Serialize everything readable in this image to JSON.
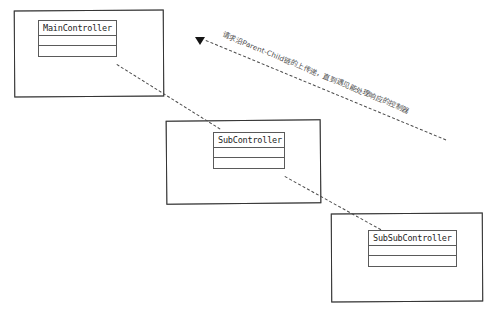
{
  "diagram": {
    "background_color": "#ffffff",
    "line_color": "#4a4a4a",
    "text_color": "#1d1d1d"
  },
  "frames": [
    {
      "id": "main",
      "label": "main-controller-frame"
    },
    {
      "id": "sub",
      "label": "sub-controller-frame"
    },
    {
      "id": "subsub",
      "label": "sub-sub-controller-frame"
    }
  ],
  "classes": [
    {
      "name": "MainController",
      "compartments": [
        "",
        ""
      ]
    },
    {
      "name": "SubController",
      "compartments": [
        "",
        ""
      ]
    },
    {
      "name": "SubSubController",
      "compartments": [
        "",
        ""
      ]
    }
  ],
  "connectors": [
    {
      "from": "MainController",
      "to": "SubController",
      "style": "dashed"
    },
    {
      "from": "SubController",
      "to": "SubSubController",
      "style": "dashed"
    }
  ],
  "annotation": {
    "text": "请求沿Parent-Child链的上传递，直到遇见能处理响应的控制器",
    "arrow": "solid-triangle",
    "direction": "up-left",
    "style": "dashed"
  }
}
